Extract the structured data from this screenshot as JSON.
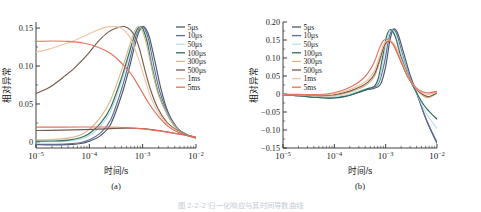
{
  "figure": {
    "caption_partial": "图 2-2-2  归一化响应与其时间导数曲线",
    "background": "#ffffff"
  },
  "series_colors": {
    "5us": "#4a5a63",
    "10us": "#5e6b9e",
    "50us": "#b9dfe3",
    "100us": "#2f6b5d",
    "300us": "#d8b98a",
    "500us": "#7a5a4e",
    "1ms": "#f2c3a0",
    "5ms": "#e8705c"
  },
  "chart_data": [
    {
      "type": "line",
      "panel": "a",
      "title": "",
      "panel_label": "(a)",
      "xlabel": "时间/s",
      "ylabel": "相对异常",
      "xscale": "log",
      "xlim": [
        1e-05,
        0.01
      ],
      "ylim": [
        -0.008,
        0.158
      ],
      "xticks": [
        "10⁻⁵",
        "10⁻⁴",
        "10⁻³",
        "10⁻²"
      ],
      "xtick_values": [
        1e-05,
        0.0001,
        0.001,
        0.01
      ],
      "yticks": [
        "0",
        "0.05",
        "0.10",
        "0.15"
      ],
      "ytick_values": [
        0,
        0.05,
        0.1,
        0.15
      ],
      "grid": false,
      "legend_position": "upper right",
      "legend": [
        "5μs",
        "10μs",
        "50μs",
        "100μs",
        "300μs",
        "500μs",
        "1ms",
        "5ms"
      ],
      "series": [
        {
          "name": "5μs",
          "color": "#4a5a63",
          "x": [
            1e-05,
            2e-05,
            4e-05,
            7e-05,
            0.0001,
            0.00016,
            0.00025,
            0.0004,
            0.00055,
            0.0007,
            0.00085,
            0.001,
            0.00115,
            0.00135,
            0.0017,
            0.0022,
            0.003,
            0.0045,
            0.007,
            0.01
          ],
          "y": [
            -0.0035,
            -0.0038,
            -0.0035,
            -0.002,
            0.001,
            0.008,
            0.023,
            0.061,
            0.095,
            0.125,
            0.145,
            0.152,
            0.149,
            0.137,
            0.106,
            0.07,
            0.039,
            0.018,
            0.009,
            0.0055
          ]
        },
        {
          "name": "10μs",
          "color": "#5e6b9e",
          "x": [
            1e-05,
            2e-05,
            4e-05,
            7e-05,
            0.0001,
            0.00016,
            0.00025,
            0.0004,
            0.00055,
            0.0007,
            0.00085,
            0.00098,
            0.0011,
            0.0013,
            0.0016,
            0.0021,
            0.003,
            0.0045,
            0.007,
            0.01
          ],
          "y": [
            -0.003,
            -0.0032,
            -0.0026,
            -0.0008,
            0.0028,
            0.0115,
            0.029,
            0.069,
            0.104,
            0.133,
            0.149,
            0.152,
            0.148,
            0.134,
            0.102,
            0.066,
            0.037,
            0.0175,
            0.0088,
            0.0055
          ]
        },
        {
          "name": "50μs",
          "color": "#b9dfe3",
          "x": [
            1e-05,
            2e-05,
            4e-05,
            7e-05,
            0.0001,
            0.00016,
            0.00025,
            0.0004,
            0.00055,
            0.0007,
            0.00082,
            0.00094,
            0.00105,
            0.00125,
            0.00155,
            0.002,
            0.003,
            0.0045,
            0.007,
            0.01
          ],
          "y": [
            0.0005,
            0.0002,
            0.001,
            0.0038,
            0.0085,
            0.02,
            0.04,
            0.079,
            0.112,
            0.138,
            0.149,
            0.152,
            0.148,
            0.132,
            0.099,
            0.064,
            0.035,
            0.0168,
            0.0086,
            0.0054
          ]
        },
        {
          "name": "100μs",
          "color": "#2f6b5d",
          "x": [
            1e-05,
            2e-05,
            4e-05,
            7e-05,
            0.0001,
            0.00016,
            0.00025,
            0.0004,
            0.00055,
            0.0007,
            0.0008,
            0.00092,
            0.00102,
            0.00122,
            0.0015,
            0.002,
            0.003,
            0.0045,
            0.007,
            0.01
          ],
          "y": [
            0.001,
            0.0012,
            0.0024,
            0.0058,
            0.0112,
            0.024,
            0.045,
            0.084,
            0.116,
            0.14,
            0.149,
            0.152,
            0.1485,
            0.131,
            0.098,
            0.0625,
            0.0345,
            0.0165,
            0.0085,
            0.0054
          ]
        },
        {
          "name": "300μs",
          "color": "#d8b98a",
          "x": [
            1e-05,
            2e-05,
            4e-05,
            7e-05,
            0.0001,
            0.00016,
            0.00025,
            0.0004,
            0.00055,
            0.00068,
            0.00078,
            0.00088,
            0.001,
            0.0012,
            0.0015,
            0.002,
            0.003,
            0.0045,
            0.007,
            0.01
          ],
          "y": [
            0.0028,
            0.0032,
            0.005,
            0.0095,
            0.0165,
            0.032,
            0.055,
            0.094,
            0.124,
            0.144,
            0.151,
            0.152,
            0.1455,
            0.127,
            0.095,
            0.061,
            0.0338,
            0.0162,
            0.0084,
            0.0053
          ]
        },
        {
          "name": "500μs",
          "color": "#7a5a4e",
          "x": [
            1e-05,
            1.5e-05,
            2.2e-05,
            3.5e-05,
            5e-05,
            7e-05,
            0.0001,
            0.00015,
            0.00022,
            0.00032,
            0.00045,
            0.0006,
            0.00075,
            0.0009,
            0.0011,
            0.0014,
            0.0019,
            0.0028,
            0.0045,
            0.007,
            0.01
          ],
          "y": [
            0.064,
            0.069,
            0.076,
            0.087,
            0.096,
            0.106,
            0.118,
            0.133,
            0.144,
            0.15,
            0.152,
            0.147,
            0.136,
            0.119,
            0.095,
            0.069,
            0.045,
            0.0265,
            0.015,
            0.0085,
            0.0055
          ]
        },
        {
          "name": "1ms",
          "color": "#f2c3a0",
          "x": [
            1e-05,
            1.5e-05,
            2.2e-05,
            3.5e-05,
            5e-05,
            7e-05,
            0.0001,
            0.00015,
            0.00022,
            0.00032,
            0.00045,
            0.0006,
            0.0008,
            0.00105,
            0.0014,
            0.0019,
            0.0028,
            0.0045,
            0.007,
            0.01
          ],
          "y": [
            0.1185,
            0.121,
            0.1245,
            0.129,
            0.133,
            0.1375,
            0.1425,
            0.148,
            0.1515,
            0.152,
            0.147,
            0.136,
            0.113,
            0.087,
            0.06,
            0.04,
            0.0245,
            0.014,
            0.0082,
            0.0055
          ]
        },
        {
          "name": "5ms",
          "color": "#e8705c",
          "x": [
            1e-05,
            2e-05,
            4e-05,
            8e-05,
            0.00015,
            0.00025,
            0.0004,
            0.0006,
            0.0009,
            0.0013,
            0.002,
            0.003,
            0.0045,
            0.007,
            0.01
          ],
          "y": [
            0.1325,
            0.133,
            0.1325,
            0.13,
            0.1245,
            0.1165,
            0.104,
            0.09,
            0.07,
            0.051,
            0.033,
            0.0205,
            0.013,
            0.0082,
            0.0056
          ]
        },
        {
          "name": "500μs-low",
          "color": "#7a5a4e",
          "x": [
            1e-05,
            3e-05,
            8e-05,
            0.0002,
            0.0005,
            0.001,
            0.002,
            0.004,
            0.007,
            0.01
          ],
          "y": [
            0.015,
            0.0155,
            0.0162,
            0.0172,
            0.018,
            0.0175,
            0.015,
            0.0115,
            0.0085,
            0.0062
          ]
        },
        {
          "name": "5ms-low",
          "color": "#e8705c",
          "x": [
            1e-05,
            3e-05,
            8e-05,
            0.0002,
            0.0005,
            0.001,
            0.002,
            0.004,
            0.007,
            0.01
          ],
          "y": [
            0.0195,
            0.0196,
            0.0197,
            0.0196,
            0.0188,
            0.0172,
            0.0145,
            0.0112,
            0.0083,
            0.0062
          ]
        }
      ]
    },
    {
      "type": "line",
      "panel": "b",
      "title": "",
      "panel_label": "(b)",
      "xlabel": "时间/s",
      "ylabel": "相对异常",
      "xscale": "log",
      "xlim": [
        1e-05,
        0.01
      ],
      "ylim": [
        -0.15,
        0.2
      ],
      "xticks": [
        "10⁻⁵",
        "10⁻⁴",
        "10⁻³",
        "10⁻²"
      ],
      "xtick_values": [
        1e-05,
        0.0001,
        0.001,
        0.01
      ],
      "yticks": [
        "-0.15",
        "-0.10",
        "-0.05",
        "0",
        "0.05",
        "0.10",
        "0.15",
        "0.20"
      ],
      "ytick_values": [
        -0.15,
        -0.1,
        -0.05,
        0,
        0.05,
        0.1,
        0.15,
        0.2
      ],
      "grid": false,
      "legend_position": "upper left",
      "legend": [
        "5μs",
        "10μs",
        "50μs",
        "100μs",
        "300μs",
        "500μs",
        "1ms",
        "5ms"
      ],
      "series": [
        {
          "name": "5μs",
          "color": "#4a5a63",
          "x": [
            1e-05,
            2e-05,
            4e-05,
            7e-05,
            0.0001,
            0.00015,
            0.00022,
            0.00032,
            0.00045,
            0.0006,
            0.0008,
            0.001,
            0.0012,
            0.0014,
            0.0017,
            0.0022,
            0.003,
            0.004,
            0.0055,
            0.007,
            0.01
          ],
          "y": [
            -0.002,
            -0.0048,
            -0.0085,
            -0.0105,
            -0.01,
            -0.0068,
            -0.0015,
            0.006,
            0.0125,
            0.016,
            0.028,
            0.076,
            0.146,
            0.179,
            0.17,
            0.118,
            0.052,
            0.005,
            -0.053,
            -0.09,
            -0.137
          ]
        },
        {
          "name": "10μs",
          "color": "#5e6b9e",
          "x": [
            1e-05,
            2e-05,
            4e-05,
            7e-05,
            0.0001,
            0.00015,
            0.00022,
            0.00032,
            0.00045,
            0.0006,
            0.00075,
            0.00095,
            0.00115,
            0.00135,
            0.00165,
            0.0021,
            0.0029,
            0.004,
            0.0055,
            0.007,
            0.01
          ],
          "y": [
            -0.002,
            -0.0045,
            -0.008,
            -0.0098,
            -0.009,
            -0.0055,
            0.0,
            0.0075,
            0.014,
            0.0185,
            0.033,
            0.088,
            0.153,
            0.179,
            0.166,
            0.112,
            0.047,
            0.003,
            -0.052,
            -0.088,
            -0.134
          ]
        },
        {
          "name": "50μs",
          "color": "#b9dfe3",
          "x": [
            1e-05,
            2e-05,
            4e-05,
            7e-05,
            0.0001,
            0.00015,
            0.00022,
            0.00032,
            0.00045,
            0.0006,
            0.00075,
            0.0009,
            0.0011,
            0.0013,
            0.0016,
            0.0021,
            0.0029,
            0.004,
            0.0055,
            0.007,
            0.01
          ],
          "y": [
            -0.0018,
            -0.004,
            -0.0072,
            -0.0088,
            -0.0078,
            -0.004,
            0.0018,
            0.0095,
            0.016,
            0.021,
            0.04,
            0.096,
            0.158,
            0.178,
            0.16,
            0.105,
            0.044,
            0.004,
            -0.04,
            -0.066,
            -0.096
          ]
        },
        {
          "name": "100μs",
          "color": "#2f6b5d",
          "x": [
            1e-05,
            2e-05,
            4e-05,
            7e-05,
            0.0001,
            0.00015,
            0.00022,
            0.00032,
            0.00045,
            0.0006,
            0.00072,
            0.00088,
            0.00105,
            0.00125,
            0.00155,
            0.002,
            0.0029,
            0.004,
            0.0055,
            0.007,
            0.01
          ],
          "y": [
            -0.002,
            -0.0048,
            -0.009,
            -0.0115,
            -0.011,
            -0.0078,
            -0.002,
            0.007,
            0.015,
            0.021,
            0.044,
            0.106,
            0.162,
            0.179,
            0.158,
            0.102,
            0.042,
            0.0035,
            -0.03,
            -0.048,
            -0.07
          ]
        },
        {
          "name": "300μs",
          "color": "#d8b98a",
          "x": [
            1e-05,
            2e-05,
            4e-05,
            7e-05,
            0.0001,
            0.00015,
            0.00022,
            0.00032,
            0.00045,
            0.0006,
            0.00075,
            0.0009,
            0.00105,
            0.0012,
            0.00145,
            0.0019,
            0.0027,
            0.004,
            0.0055,
            0.007,
            0.01
          ],
          "y": [
            -0.0015,
            -0.003,
            -0.0055,
            -0.006,
            -0.004,
            0.0005,
            0.007,
            0.016,
            0.028,
            0.048,
            0.085,
            0.125,
            0.145,
            0.148,
            0.139,
            0.1,
            0.048,
            0.012,
            -0.006,
            -0.01,
            0.002
          ]
        },
        {
          "name": "500μs",
          "color": "#7a5a4e",
          "x": [
            1e-05,
            2e-05,
            4e-05,
            7e-05,
            0.0001,
            0.00015,
            0.00022,
            0.00032,
            0.00045,
            0.0006,
            0.00075,
            0.0009,
            0.00105,
            0.0012,
            0.00145,
            0.0019,
            0.0027,
            0.004,
            0.0055,
            0.007,
            0.01
          ],
          "y": [
            -0.0012,
            -0.0025,
            -0.0042,
            -0.0042,
            -0.0018,
            0.003,
            0.01,
            0.02,
            0.033,
            0.054,
            0.091,
            0.128,
            0.145,
            0.147,
            0.137,
            0.098,
            0.047,
            0.013,
            -0.003,
            -0.007,
            0.003
          ]
        },
        {
          "name": "1ms",
          "color": "#f2c3a0",
          "x": [
            1e-05,
            2e-05,
            4e-05,
            7e-05,
            0.0001,
            0.00015,
            0.00022,
            0.00032,
            0.00045,
            0.0006,
            0.00075,
            0.0009,
            0.00105,
            0.00125,
            0.00155,
            0.002,
            0.0028,
            0.004,
            0.0055,
            0.007,
            0.01
          ],
          "y": [
            -0.001,
            -0.0018,
            -0.0028,
            -0.002,
            0.001,
            0.0065,
            0.0145,
            0.0255,
            0.04,
            0.064,
            0.102,
            0.136,
            0.148,
            0.148,
            0.133,
            0.095,
            0.046,
            0.014,
            0.002,
            -0.001,
            0.006
          ]
        },
        {
          "name": "5ms",
          "color": "#e8705c",
          "x": [
            1e-05,
            2e-05,
            4e-05,
            7e-05,
            0.0001,
            0.00015,
            0.00022,
            0.00032,
            0.00045,
            0.0006,
            0.00075,
            0.0009,
            0.00105,
            0.0012,
            0.00145,
            0.0019,
            0.0027,
            0.004,
            0.0055,
            0.007,
            0.01
          ],
          "y": [
            -0.0008,
            -0.0012,
            -0.0015,
            0.0,
            0.004,
            0.011,
            0.0215,
            0.036,
            0.058,
            0.089,
            0.126,
            0.148,
            0.152,
            0.148,
            0.133,
            0.096,
            0.048,
            0.0165,
            0.0055,
            0.003,
            0.0075
          ]
        }
      ]
    }
  ]
}
